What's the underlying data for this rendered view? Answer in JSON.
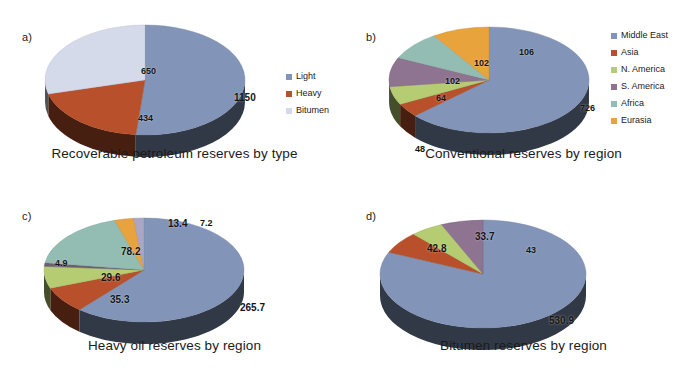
{
  "figure": {
    "background": "#ffffff",
    "panels": [
      "a)",
      "b)",
      "c)",
      "d)"
    ]
  },
  "palette": {
    "blue": "#8295b8",
    "blue_dark_side": "#2b3347",
    "orange": "#b8512b",
    "orange_dark_side": "#5e2a17",
    "lavender": "#d5daea",
    "lavender_dark_side": "#3b4156",
    "green": "#b5cc72",
    "purple": "#8e7490",
    "teal": "#93bcb3",
    "gold": "#e8a33d",
    "europe_purple": "#6b5f74",
    "africa_lav": "#aaa7c4"
  },
  "panels": {
    "a": {
      "letter": "a)",
      "caption": "Recoverable petroleum reserves by type",
      "legend": [
        {
          "label": "Light",
          "color": "#8295b8"
        },
        {
          "label": "Heavy",
          "color": "#b8512b"
        },
        {
          "label": "Bitumen",
          "color": "#d5daea"
        }
      ],
      "labels": [
        {
          "text": "1150",
          "x": 196,
          "y": 74
        },
        {
          "text": "434",
          "x": 100,
          "y": 95
        },
        {
          "text": "650",
          "x": 103,
          "y": 48
        }
      ]
    },
    "b": {
      "letter": "b)",
      "caption": "Conventional reserves by region",
      "legend": [
        {
          "label": "Middle East",
          "color": "#8295b8"
        },
        {
          "label": "Asia",
          "color": "#b8512b"
        },
        {
          "label": "N. America",
          "color": "#b5cc72"
        },
        {
          "label": "S. America",
          "color": "#8e7490"
        },
        {
          "label": "Africa",
          "color": "#93bcb3"
        },
        {
          "label": "Eurasia",
          "color": "#e8a33d"
        }
      ],
      "labels": [
        {
          "text": "726",
          "x": 201,
          "y": 85
        },
        {
          "text": "48",
          "x": 36,
          "y": 126
        },
        {
          "text": "64",
          "x": 57,
          "y": 75
        },
        {
          "text": "102",
          "x": 66,
          "y": 58
        },
        {
          "text": "102",
          "x": 95,
          "y": 40
        },
        {
          "text": "106",
          "x": 140,
          "y": 29
        }
      ]
    },
    "c": {
      "letter": "c)",
      "caption": "Heavy oil reserves by region",
      "legend": [
        {
          "label": "S. America",
          "color": "#8295b8"
        },
        {
          "label": "N.America",
          "color": "#b8512b"
        },
        {
          "label": "Asia",
          "color": "#b5cc72"
        },
        {
          "label": "Europe",
          "color": "#6b5f74"
        },
        {
          "label": "Middle East",
          "color": "#93bcb3"
        },
        {
          "label": "Russia",
          "color": "#e8a33d"
        },
        {
          "label": "Africa",
          "color": "#aaa7c4"
        }
      ],
      "labels": [
        {
          "text": "265.7",
          "x": 206,
          "y": 92
        },
        {
          "text": "35.3",
          "x": 76,
          "y": 84
        },
        {
          "text": "29.6",
          "x": 67,
          "y": 62
        },
        {
          "text": "4.9",
          "x": 21,
          "y": 48
        },
        {
          "text": "78.2",
          "x": 87,
          "y": 36
        },
        {
          "text": "13.4",
          "x": 134,
          "y": 8
        },
        {
          "text": "7.2",
          "x": 166,
          "y": 8
        }
      ]
    },
    "d": {
      "letter": "d)",
      "caption": "Bitumen reserves by region",
      "legend": [
        {
          "label": "N.America",
          "color": "#8295b8"
        },
        {
          "label": "Asia",
          "color": "#b8512b"
        },
        {
          "label": "Russia",
          "color": "#b5cc72"
        },
        {
          "label": "Africa",
          "color": "#8e7490"
        }
      ],
      "labels": [
        {
          "text": "530.9",
          "x": 178,
          "y": 101
        },
        {
          "text": "42.8",
          "x": 56,
          "y": 29
        },
        {
          "text": "33.7",
          "x": 104,
          "y": 17
        },
        {
          "text": "43",
          "x": 155,
          "y": 31
        }
      ]
    }
  },
  "chart_data": [
    {
      "type": "pie",
      "panel": "a)",
      "title": "Recoverable petroleum reserves by type",
      "categories": [
        "Light",
        "Heavy",
        "Bitumen"
      ],
      "values": [
        1150,
        434,
        650
      ],
      "colors": [
        "#8295b8",
        "#b8512b",
        "#d5daea"
      ],
      "legend_position": "right",
      "three_d": true,
      "start_angle_deg": 0
    },
    {
      "type": "pie",
      "panel": "b)",
      "title": "Conventional reserves by region",
      "categories": [
        "Middle East",
        "Asia",
        "N. America",
        "S. America",
        "Africa",
        "Eurasia"
      ],
      "values": [
        726,
        48,
        64,
        102,
        102,
        106
      ],
      "colors": [
        "#8295b8",
        "#b8512b",
        "#b5cc72",
        "#8e7490",
        "#93bcb3",
        "#e8a33d"
      ],
      "legend_position": "right",
      "three_d": true,
      "start_angle_deg": 0
    },
    {
      "type": "pie",
      "panel": "c)",
      "title": "Heavy oil reserves by region",
      "categories": [
        "S. America",
        "N.America",
        "Asia",
        "Europe",
        "Middle East",
        "Russia",
        "Africa"
      ],
      "values": [
        265.7,
        35.3,
        29.6,
        4.9,
        78.2,
        13.4,
        7.2
      ],
      "colors": [
        "#8295b8",
        "#b8512b",
        "#b5cc72",
        "#6b5f74",
        "#93bcb3",
        "#e8a33d",
        "#aaa7c4"
      ],
      "legend_position": "right",
      "three_d": true,
      "start_angle_deg": 0
    },
    {
      "type": "pie",
      "panel": "d)",
      "title": "Bitumen reserves by region",
      "categories": [
        "N.America",
        "Asia",
        "Russia",
        "Africa"
      ],
      "values": [
        530.9,
        42.8,
        33.7,
        43
      ],
      "colors": [
        "#8295b8",
        "#b8512b",
        "#b5cc72",
        "#8e7490"
      ],
      "legend_position": "right",
      "three_d": true,
      "start_angle_deg": 0
    }
  ]
}
